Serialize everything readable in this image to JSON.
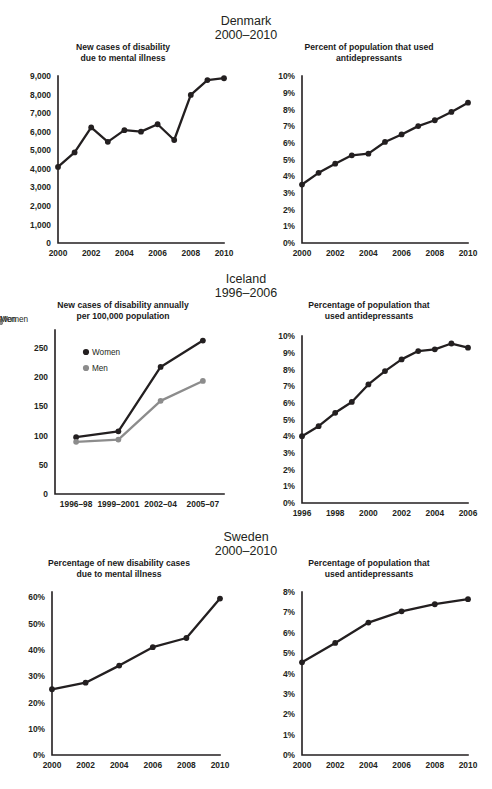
{
  "sections": [
    {
      "country": "Denmark",
      "period": "2000–2010",
      "left": {
        "title": "New cases of disability\ndue to mental illness",
        "title_line1": "New cases of disability",
        "title_line2": "due to mental illness"
      },
      "right": {
        "title_line1": "Percent of population that used",
        "title_line2": "antidepressants"
      }
    },
    {
      "country": "Iceland",
      "period": "1996–2006",
      "left": {
        "title_line1": "New cases of disability annually",
        "title_line2": "per 100,000 population"
      },
      "right": {
        "title_line1": "Percentage of population that",
        "title_line2": "used antidepressants"
      }
    },
    {
      "country": "Sweden",
      "period": "2000–2010",
      "left": {
        "title_line1": "Percentage of new disability cases",
        "title_line2": "due to mental illness"
      },
      "right": {
        "title_line1": "Percentage of population that",
        "title_line2": "used antidepressants"
      }
    }
  ],
  "colors": {
    "ink": "#231f20",
    "women": "#231f20",
    "men": "#8c8c8c",
    "background": "#ffffff"
  },
  "chart_data": [
    {
      "id": "denmark-disability",
      "type": "line",
      "title": "New cases of disability due to mental illness",
      "country": "Denmark",
      "period": "2000–2010",
      "xlabel": "",
      "ylabel": "",
      "x": [
        2000,
        2001,
        2002,
        2003,
        2004,
        2005,
        2006,
        2007,
        2008,
        2009,
        2010
      ],
      "values": [
        4100,
        4880,
        6230,
        5450,
        6080,
        6000,
        6400,
        5550,
        7980,
        8780,
        8880
      ],
      "ylim": [
        0,
        9000
      ],
      "yticks": [
        0,
        1000,
        2000,
        3000,
        4000,
        5000,
        6000,
        7000,
        8000,
        9000
      ],
      "yticklabels": [
        "0",
        "1,000",
        "2,000",
        "3,000",
        "4,000",
        "5,000",
        "6,000",
        "7,000",
        "8,000",
        "9,000"
      ],
      "xticks": [
        2000,
        2002,
        2004,
        2006,
        2008,
        2010
      ],
      "xticklabels": [
        "2000",
        "2002",
        "2004",
        "2006",
        "2008",
        "2010"
      ],
      "xlim": [
        2000,
        2010
      ],
      "grid": false,
      "legend": null,
      "markers": true
    },
    {
      "id": "denmark-antidepressants",
      "type": "line",
      "title": "Percent of population that used antidepressants",
      "country": "Denmark",
      "period": "2000–2010",
      "xlabel": "",
      "ylabel": "",
      "x": [
        2000,
        2001,
        2002,
        2003,
        2004,
        2005,
        2006,
        2007,
        2008,
        2009,
        2010
      ],
      "values": [
        3.5,
        4.2,
        4.75,
        5.25,
        5.35,
        6.05,
        6.5,
        7.0,
        7.35,
        7.85,
        8.4
      ],
      "ylim": [
        0,
        10
      ],
      "yticks": [
        0,
        1,
        2,
        3,
        4,
        5,
        6,
        7,
        8,
        9,
        10
      ],
      "yticklabels": [
        "0%",
        "1%",
        "2%",
        "3%",
        "4%",
        "5%",
        "6%",
        "7%",
        "8%",
        "9%",
        "10%"
      ],
      "xticks": [
        2000,
        2002,
        2004,
        2006,
        2008,
        2010
      ],
      "xticklabels": [
        "2000",
        "2002",
        "2004",
        "2006",
        "2008",
        "2010"
      ],
      "xlim": [
        2000,
        2010
      ],
      "grid": false,
      "legend": null,
      "markers": true
    },
    {
      "id": "iceland-disability",
      "type": "line",
      "title": "New cases of disability annually per 100,000 population",
      "country": "Iceland",
      "period": "1996–2006",
      "xlabel": "",
      "ylabel": "",
      "categories": [
        "1996–98",
        "1999–2001",
        "2002–04",
        "2005–07"
      ],
      "series": [
        {
          "name": "Women",
          "color": "#231f20",
          "values": [
            97,
            107,
            217,
            262
          ]
        },
        {
          "name": "Men",
          "color": "#8c8c8c",
          "values": [
            89,
            93,
            159,
            193
          ]
        }
      ],
      "ylim": [
        0,
        280
      ],
      "yticks": [
        0,
        50,
        100,
        150,
        200,
        250
      ],
      "yticklabels": [
        "0",
        "50",
        "100",
        "150",
        "200",
        "250"
      ],
      "grid": false,
      "legend": {
        "position": "upper-left-inside",
        "entries": [
          "Women",
          "Men"
        ]
      },
      "markers": true
    },
    {
      "id": "iceland-antidepressants",
      "type": "line",
      "title": "Percentage of population that used antidepressants",
      "country": "Iceland",
      "period": "1996–2006",
      "xlabel": "",
      "ylabel": "",
      "x": [
        1996,
        1997,
        1998,
        1999,
        2000,
        2001,
        2002,
        2003,
        2004,
        2005,
        2006
      ],
      "values": [
        4.0,
        4.6,
        5.4,
        6.05,
        7.1,
        7.9,
        8.6,
        9.1,
        9.2,
        9.55,
        9.3
      ],
      "ylim": [
        0,
        10
      ],
      "yticks": [
        0,
        1,
        2,
        3,
        4,
        5,
        6,
        7,
        8,
        9,
        10
      ],
      "yticklabels": [
        "0%",
        "1%",
        "2%",
        "3%",
        "4%",
        "5%",
        "6%",
        "7%",
        "8%",
        "9%",
        "10%"
      ],
      "xticks": [
        1996,
        1998,
        2000,
        2002,
        2004,
        2006
      ],
      "xticklabels": [
        "1996",
        "1998",
        "2000",
        "2002",
        "2004",
        "2006"
      ],
      "xlim": [
        1996,
        2006
      ],
      "grid": false,
      "legend": null,
      "markers": true
    },
    {
      "id": "sweden-disability",
      "type": "line",
      "title": "Percentage of new disability cases due to mental illness",
      "country": "Sweden",
      "period": "2000–2010",
      "xlabel": "",
      "ylabel": "",
      "x": [
        2000,
        2002,
        2004,
        2006,
        2008,
        2010
      ],
      "values": [
        25,
        27.5,
        34,
        41,
        44.5,
        59.5
      ],
      "ylim": [
        0,
        62
      ],
      "yticks": [
        0,
        10,
        20,
        30,
        40,
        50,
        60
      ],
      "yticklabels": [
        "0%",
        "10%",
        "20%",
        "30%",
        "40%",
        "50%",
        "60%"
      ],
      "xticks": [
        2000,
        2002,
        2004,
        2006,
        2008,
        2010
      ],
      "xticklabels": [
        "2000",
        "2002",
        "2004",
        "2006",
        "2008",
        "2010"
      ],
      "xlim": [
        2000,
        2010
      ],
      "grid": false,
      "legend": null,
      "markers": true
    },
    {
      "id": "sweden-antidepressants",
      "type": "line",
      "title": "Percentage of population that used antidepressants",
      "country": "Sweden",
      "period": "2000–2010",
      "xlabel": "",
      "ylabel": "",
      "x": [
        2000,
        2002,
        2004,
        2006,
        2008,
        2010
      ],
      "values": [
        4.55,
        5.5,
        6.5,
        7.05,
        7.4,
        7.65
      ],
      "ylim": [
        0,
        8
      ],
      "yticks": [
        0,
        1,
        2,
        3,
        4,
        5,
        6,
        7,
        8
      ],
      "yticklabels": [
        "0%",
        "1%",
        "2%",
        "3%",
        "4%",
        "5%",
        "6%",
        "7%",
        "8%"
      ],
      "xticks": [
        2000,
        2002,
        2004,
        2006,
        2008,
        2010
      ],
      "xticklabels": [
        "2000",
        "2002",
        "2004",
        "2006",
        "2008",
        "2010"
      ],
      "xlim": [
        2000,
        2010
      ],
      "grid": false,
      "legend": null,
      "markers": true
    }
  ]
}
